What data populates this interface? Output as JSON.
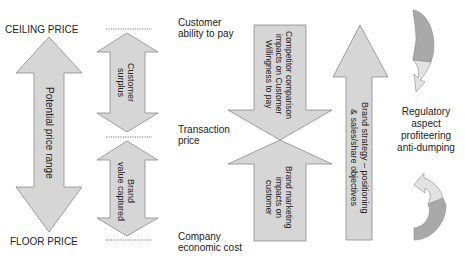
{
  "left_labels": {
    "ceiling": "CEILING PRICE",
    "floor": "FLOOR PRICE"
  },
  "price_range_arrow": {
    "label": "Potential price range"
  },
  "customer_surplus_arrow": {
    "line1": "Customer",
    "line2": "surplus"
  },
  "brand_value_arrow": {
    "line1": "Brand",
    "line2": "value captured"
  },
  "price_levels": {
    "top": {
      "line1": "Customer",
      "line2": "ability to pay"
    },
    "middle": {
      "line1": "Transaction",
      "line2": "price"
    },
    "bottom": {
      "line1": "Company",
      "line2": "economic cost"
    }
  },
  "competitor_arrow": {
    "line1": "Competitor comparison",
    "line2": "impacts on Customer",
    "line3": "Willingness to pay"
  },
  "brand_marketing_arrow": {
    "line1": "Brand marketing",
    "line2": "impacts on",
    "line3": "customer"
  },
  "brand_strategy_arrow": {
    "line1": "Brand strategy – positioning",
    "line2": "& sales/share objectives"
  },
  "regulatory": {
    "line1": "Regulatory",
    "line2": "aspect",
    "line3": "profiteering",
    "line4": "anti-dumping"
  },
  "colors": {
    "arrow_fill": "#d6d6d6",
    "arrow_stroke": "#8a8a8a",
    "curve_dark": "#a9a9a9",
    "curve_light": "#e2e2e2"
  }
}
